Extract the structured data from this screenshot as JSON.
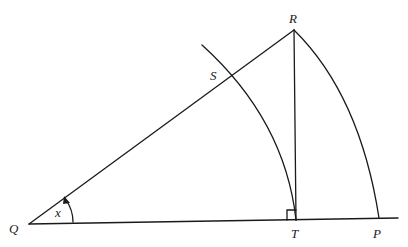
{
  "diagram": {
    "type": "geometry",
    "points": {
      "Q": {
        "label": "Q"
      },
      "R": {
        "label": "R"
      },
      "S": {
        "label": "S"
      },
      "T": {
        "label": "T"
      },
      "P": {
        "label": "P"
      }
    },
    "angle_label": "x",
    "right_angle_at": "T",
    "segments": [
      "QR",
      "QP",
      "RT"
    ],
    "arcs": [
      "R to P (outer, centre Q)",
      "through S to T (inner, centre Q)"
    ],
    "stroke_color": "#1a1a1a",
    "background_color": "#ffffff"
  }
}
